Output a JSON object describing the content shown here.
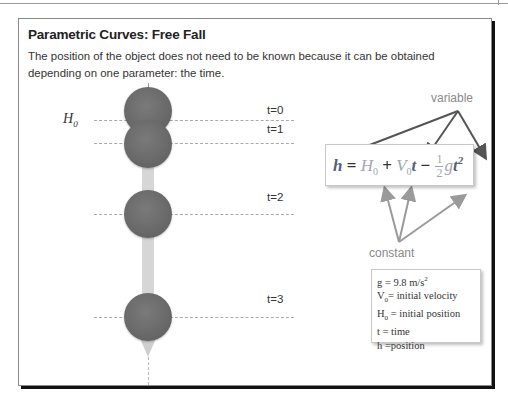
{
  "slide": {
    "title": "Parametric Curves: Free Fall",
    "description": "The position of the object does not need to be known because it can be obtained depending on one parameter: the time."
  },
  "diagram": {
    "height_label": "H",
    "height_label_sub": "0",
    "time_labels": [
      "t=0",
      "t=1",
      "t=2",
      "t=3"
    ],
    "ball_color": "#6a6a6a",
    "arrow_color": "#d6d6d6"
  },
  "formula": {
    "h": "h",
    "eq": " = ",
    "H": "H",
    "H_sub": "0",
    "plus": " + ",
    "V": "V",
    "V_sub": "0",
    "t1": "t",
    "minus": " − ",
    "frac_num": "1",
    "frac_den": "2",
    "g": "g",
    "t2": "t",
    "t2_exp": "2",
    "variable_color": "#55607a",
    "constant_color": "#a0a6b3"
  },
  "annotations": {
    "variable": "variable",
    "constant": "constant"
  },
  "legend": {
    "items": [
      {
        "sym": "g",
        "sub": "",
        "text": " = 9.8 m/s",
        "sup": "2"
      },
      {
        "sym": "V",
        "sub": "0",
        "text": "= initial velocity",
        "sup": ""
      },
      {
        "sym": "H",
        "sub": "0",
        "text": " = initial position",
        "sup": ""
      },
      {
        "sym": "t",
        "sub": "",
        "text": " = time",
        "sup": ""
      },
      {
        "sym": "h",
        "sub": "",
        "text": " =position",
        "sup": ""
      }
    ]
  }
}
